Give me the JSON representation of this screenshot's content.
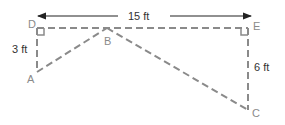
{
  "diagram": {
    "points": {
      "A": {
        "label": "A",
        "x": 37,
        "y": 72
      },
      "B": {
        "label": "B",
        "x": 107,
        "y": 28
      },
      "C": {
        "label": "C",
        "x": 248,
        "y": 110
      },
      "D": {
        "label": "D",
        "x": 37,
        "y": 28
      },
      "E": {
        "label": "E",
        "x": 248,
        "y": 28
      }
    },
    "dimensions": {
      "DE": "15 ft",
      "DA": "3 ft",
      "EC": "6 ft"
    },
    "colors": {
      "dashed_line": "#8a8a8a",
      "arrow": "#222222",
      "text": "#333333"
    }
  }
}
